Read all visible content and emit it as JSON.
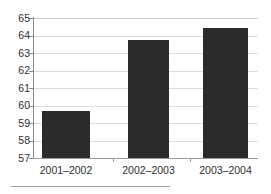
{
  "chart_data": {
    "type": "bar",
    "title": "",
    "subtitle": "",
    "xlabel": "",
    "ylabel": "",
    "categories": [
      "2001–2002",
      "2002–2003",
      "2003–2004"
    ],
    "values": [
      59.7,
      63.75,
      64.4
    ],
    "series": [
      {
        "name": "",
        "values": [
          59.7,
          63.75,
          64.4
        ]
      }
    ],
    "ylim": [
      57,
      65
    ],
    "yticks": [
      57,
      58,
      59,
      60,
      61,
      62,
      63,
      64,
      65
    ],
    "ytick_labels": [
      "57",
      "58",
      "59",
      "60",
      "61",
      "62",
      "63",
      "64",
      "65"
    ],
    "grid": true,
    "grid_axis": "y",
    "legend": false,
    "legend_position": "none",
    "annotations": [],
    "bar_color": "#2b2b2b",
    "gridline_color": "#dcdcdc",
    "axis_color": "#8a8a8a",
    "background_color": "#ffffff"
  },
  "figure": {
    "footer_rule": true
  }
}
